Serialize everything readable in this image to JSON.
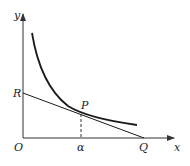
{
  "diagram": {
    "axes": {
      "x_label": "x",
      "y_label": "y",
      "origin_label": "O"
    },
    "points": {
      "R": "R",
      "P": "P",
      "Q": "Q",
      "alpha": "α"
    },
    "colors": {
      "stroke": "#1a1a1a",
      "axis": "#333333"
    },
    "elements": [
      "hyperbola-like decreasing curve",
      "tangent line through R, P, Q",
      "dashed vertical from P to α on x-axis"
    ]
  }
}
